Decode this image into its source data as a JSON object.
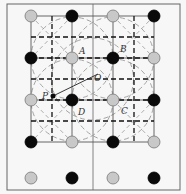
{
  "figure": {
    "background": "#f7f7f7",
    "frame": {
      "x": 7,
      "y": 4,
      "w": 173,
      "h": 186,
      "divider_x": 93,
      "color": "#666666"
    },
    "colors": {
      "gray_atom": "#c8c8c8",
      "black_atom": "#0a0a0a",
      "solid_line": "#555555",
      "dashed_line": "#111111",
      "dashed_circle": "#9a9a9a"
    },
    "columns_x": [
      31,
      72,
      113,
      154
    ],
    "rows": [
      {
        "y": 16,
        "types": [
          "gray",
          "black",
          "gray",
          "black"
        ]
      },
      {
        "y": 58,
        "types": [
          "black",
          "gray",
          "black",
          "gray"
        ]
      },
      {
        "y": 100,
        "types": [
          "gray",
          "black",
          "gray",
          "black"
        ]
      },
      {
        "y": 142,
        "types": [
          "black",
          "gray",
          "black",
          "gray"
        ]
      },
      {
        "y": 178,
        "types": [
          "gray",
          "black",
          "gray",
          "black"
        ]
      }
    ],
    "point_P": {
      "x": 53,
      "y": 96
    },
    "point_O": {
      "x": 98,
      "y": 74
    },
    "labels": [
      {
        "text": "A",
        "x": 79,
        "y": 54
      },
      {
        "text": "B",
        "x": 120,
        "y": 52
      },
      {
        "text": "O",
        "x": 94,
        "y": 81
      },
      {
        "text": "P",
        "x": 42,
        "y": 99
      },
      {
        "text": "D",
        "x": 78,
        "y": 115
      },
      {
        "text": "C",
        "x": 121,
        "y": 114
      }
    ]
  }
}
